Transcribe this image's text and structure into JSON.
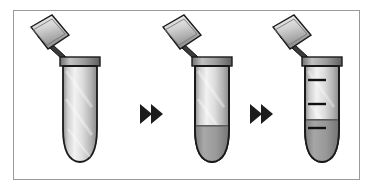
{
  "figure": {
    "title": "Microcentrifuge tube protocol sequence",
    "background_color": "#ffffff",
    "frame": {
      "border_color": "#9a9a9a",
      "fill_color": "#ffffff",
      "x": 13,
      "y": 10,
      "width": 347,
      "height": 170
    }
  },
  "palette": {
    "outline": "#1a1a1a",
    "tube_body_light": "#f2f2f2",
    "tube_body_mid": "#c9c9c9",
    "tube_body_dark": "#8f8f8f",
    "liquid_fill": "#9e9e9e",
    "liquid_fill_dark": "#8a8a8a",
    "lid_light": "#eeeeee",
    "lid_mid": "#bdbdbd",
    "lid_dark": "#7d7d7d",
    "rim_dark": "#6f6f6f",
    "graduation_mark": "#111111",
    "arrow_color": "#1c1c1c"
  },
  "steps": [
    {
      "index": 1,
      "name": "empty-tube",
      "label": "Empty tube, lid open",
      "lid_state": "open",
      "graduations": 0,
      "fill_level_percent": 0,
      "fill_label": "empty"
    },
    {
      "index": 2,
      "name": "tube-with-pellet",
      "label": "Tube containing sample at bottom",
      "lid_state": "open",
      "graduations": 0,
      "fill_level_percent": 25,
      "fill_label": "sample settled in conical bottom"
    },
    {
      "index": 3,
      "name": "graduated-tube-filled",
      "label": "Graduated tube with liquid",
      "lid_state": "open",
      "graduations": 3,
      "graduation_labels": [
        "upper mark",
        "middle mark",
        "lower mark"
      ],
      "fill_level_percent": 38,
      "fill_label": "liquid filled to lower graduation"
    }
  ],
  "arrows": [
    {
      "index": 1,
      "name": "arrow-step1-to-step2",
      "glyph": "double-chevron-right",
      "label": "next step"
    },
    {
      "index": 2,
      "name": "arrow-step2-to-step3",
      "glyph": "double-chevron-right",
      "label": "next step"
    }
  ]
}
